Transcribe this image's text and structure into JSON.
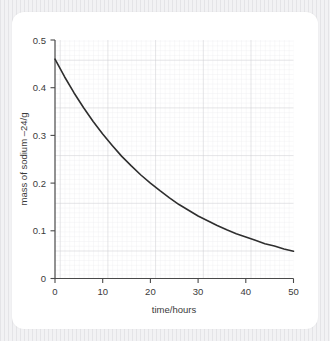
{
  "figure": {
    "background_color": "#ececed",
    "card_color": "#ffffff"
  },
  "chart_data": {
    "type": "line",
    "title": "",
    "subtitle": "",
    "xlabel": "time/hours",
    "ylabel": "mass of sodium –24/g",
    "xlim": [
      0,
      50
    ],
    "ylim": [
      0,
      0.5
    ],
    "xticks": [
      0,
      10,
      20,
      30,
      40,
      50
    ],
    "xtick_labels": [
      "0",
      "10",
      "20",
      "30",
      "40",
      "50"
    ],
    "yticks": [
      0,
      0.1,
      0.2,
      0.3,
      0.4,
      0.5
    ],
    "ytick_labels": [
      "0",
      "0.1",
      "0.2",
      "0.3",
      "0.4",
      "0.5"
    ],
    "grid": true,
    "grid_major_color": "#c9c9cf",
    "grid_minor_color": "#e6e6ea",
    "grid_minor_divisions": 10,
    "legend": false,
    "legend_position": "none",
    "line_color": "#2e2e2e",
    "line_width": 1.6,
    "annotations": [],
    "series": [
      {
        "name": "mass of sodium-24",
        "model": "exponential decay",
        "initial_value": 0.46,
        "half_life_hours": 15.5,
        "x": [
          0,
          2,
          4,
          6,
          8,
          10,
          12,
          14,
          16,
          18,
          20,
          22,
          24,
          26,
          28,
          30,
          32,
          34,
          36,
          38,
          40,
          42,
          44,
          46,
          48,
          50
        ],
        "values": [
          0.46,
          0.423,
          0.389,
          0.358,
          0.329,
          0.303,
          0.279,
          0.256,
          0.236,
          0.217,
          0.2,
          0.184,
          0.169,
          0.155,
          0.143,
          0.131,
          0.121,
          0.111,
          0.102,
          0.094,
          0.087,
          0.08,
          0.073,
          0.068,
          0.062,
          0.057
        ]
      }
    ]
  },
  "axis_labels": {
    "x_title": "time/hours",
    "y_title": "mass of sodium –24/g"
  }
}
